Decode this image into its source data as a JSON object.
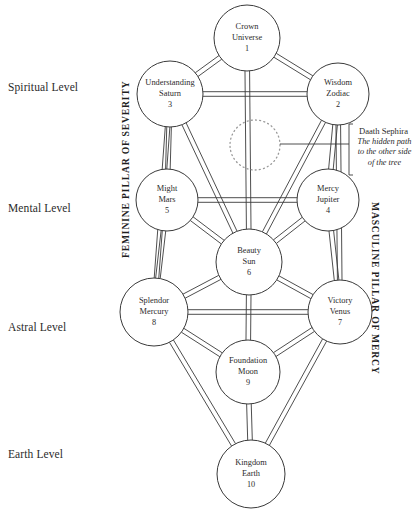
{
  "diagram": {
    "levels": [
      {
        "id": "spiritual",
        "label": "Spiritual Level",
        "y": 88
      },
      {
        "id": "mental",
        "label": "Mental Level",
        "y": 209
      },
      {
        "id": "astral",
        "label": "Astral Level",
        "y": 328
      },
      {
        "id": "earth",
        "label": "Earth Level",
        "y": 455
      }
    ],
    "pillars": {
      "left": "FEMININE PILLAR OF SEVERITY",
      "right": "MASCULINE PILLAR OF MERCY"
    },
    "annotation": {
      "title": "Daath Sephira",
      "body_line1": "The hidden path",
      "body_line2": "to the other side",
      "body_line3": "of the tree"
    },
    "hidden_node": {
      "id": "daath",
      "cx": 255,
      "cy": 145,
      "r": 25,
      "style": "dotted",
      "label": ""
    },
    "nodes": [
      {
        "id": "kether",
        "name": "Crown",
        "attribute": "Universe",
        "number": "1",
        "cx": 247,
        "cy": 38,
        "r": 33
      },
      {
        "id": "binah",
        "name": "Understanding",
        "attribute": "Saturn",
        "number": "3",
        "cx": 170,
        "cy": 94,
        "r": 33
      },
      {
        "id": "chokmah",
        "name": "Wisdom",
        "attribute": "Zodiac",
        "number": "2",
        "cx": 338,
        "cy": 94,
        "r": 31
      },
      {
        "id": "geburah",
        "name": "Might",
        "attribute": "Mars",
        "number": "5",
        "cx": 167,
        "cy": 200,
        "r": 31
      },
      {
        "id": "chesed",
        "name": "Mercy",
        "attribute": "Jupiter",
        "number": "4",
        "cx": 328,
        "cy": 200,
        "r": 31
      },
      {
        "id": "tiphereth",
        "name": "Beauty",
        "attribute": "Sun",
        "number": "6",
        "cx": 249,
        "cy": 262,
        "r": 33
      },
      {
        "id": "hod",
        "name": "Splendor",
        "attribute": "Mercury",
        "number": "8",
        "cx": 154,
        "cy": 312,
        "r": 34
      },
      {
        "id": "netzach",
        "name": "Victory",
        "attribute": "Venus",
        "number": "7",
        "cx": 340,
        "cy": 312,
        "r": 32
      },
      {
        "id": "yesod",
        "name": "Foundation",
        "attribute": "Moon",
        "number": "9",
        "cx": 248,
        "cy": 372,
        "r": 32
      },
      {
        "id": "malkuth",
        "name": "Kingdom",
        "attribute": "Earth",
        "number": "10",
        "cx": 251,
        "cy": 474,
        "r": 34
      }
    ],
    "paths": [
      [
        "kether",
        "binah"
      ],
      [
        "kether",
        "chokmah"
      ],
      [
        "kether",
        "tiphereth"
      ],
      [
        "binah",
        "chokmah"
      ],
      [
        "binah",
        "geburah"
      ],
      [
        "binah",
        "tiphereth"
      ],
      [
        "binah",
        "hod"
      ],
      [
        "chokmah",
        "chesed"
      ],
      [
        "chokmah",
        "tiphereth"
      ],
      [
        "chokmah",
        "netzach"
      ],
      [
        "geburah",
        "chesed"
      ],
      [
        "geburah",
        "tiphereth"
      ],
      [
        "geburah",
        "hod"
      ],
      [
        "chesed",
        "tiphereth"
      ],
      [
        "chesed",
        "netzach"
      ],
      [
        "tiphereth",
        "hod"
      ],
      [
        "tiphereth",
        "netzach"
      ],
      [
        "tiphereth",
        "yesod"
      ],
      [
        "hod",
        "netzach"
      ],
      [
        "hod",
        "yesod"
      ],
      [
        "hod",
        "malkuth"
      ],
      [
        "netzach",
        "yesod"
      ],
      [
        "netzach",
        "malkuth"
      ],
      [
        "yesod",
        "malkuth"
      ]
    ]
  }
}
